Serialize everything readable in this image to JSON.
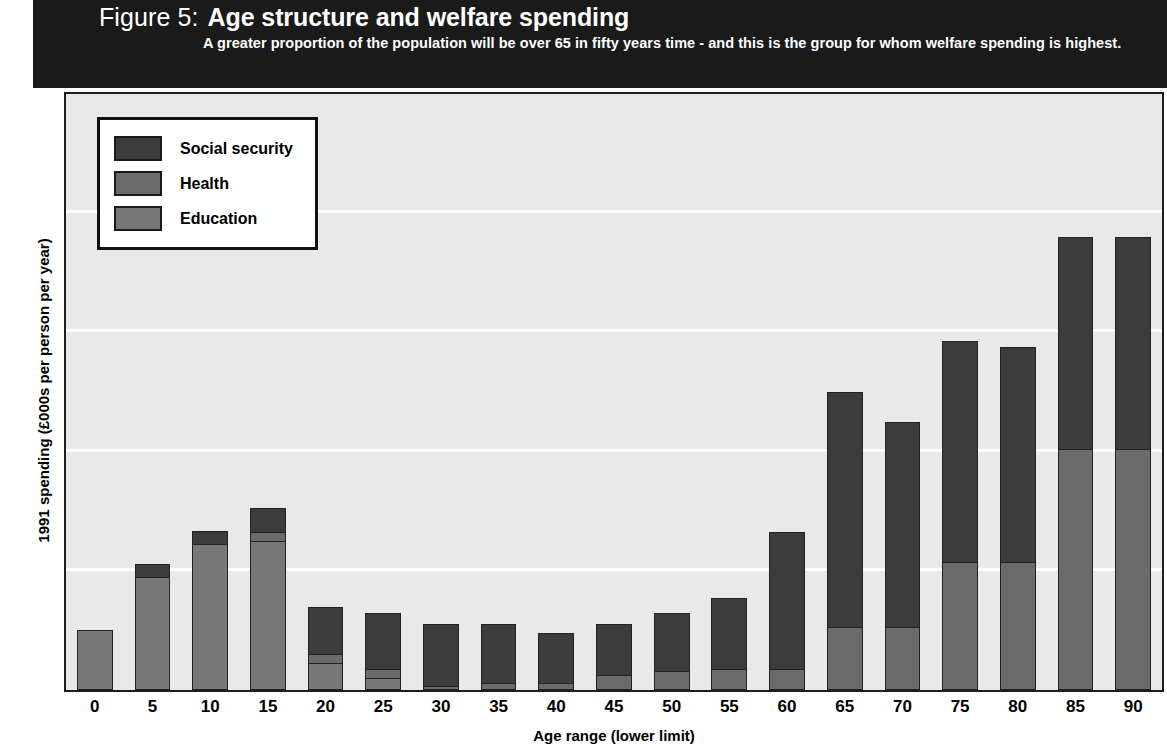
{
  "banner": {
    "figure_label": "Figure 5:",
    "title": "Age structure and welfare spending",
    "subtitle": "A greater proportion of the population will be over 65 in fifty years time - and this is the group for whom welfare spending is highest."
  },
  "legend": {
    "items": [
      {
        "label": "Social security",
        "color": "#3c3c3c",
        "key": "social_security"
      },
      {
        "label": "Health",
        "color": "#6b6b6b",
        "key": "health"
      },
      {
        "label": "Education",
        "color": "#787878",
        "key": "education"
      }
    ]
  },
  "axes": {
    "y_title": "1991 spending (£000s per person per year)",
    "x_title": "Age range (lower limit)",
    "y_ticks": [
      "0",
      "2",
      "4",
      "6",
      "8",
      "10"
    ],
    "x_ticks": [
      "0",
      "5",
      "10",
      "15",
      "20",
      "25",
      "30",
      "35",
      "40",
      "45",
      "50",
      "55",
      "60",
      "65",
      "70",
      "75",
      "80",
      "85",
      "90"
    ]
  },
  "chart_data": {
    "type": "bar",
    "stacked": true,
    "title": "Age structure and welfare spending",
    "subtitle": "A greater proportion of the population will be over 65 in fifty years time - and this is the group for whom welfare spending is highest.",
    "xlabel": "Age range (lower limit)",
    "ylabel": "1991 spending (£000s per person per year)",
    "ylim": [
      0,
      10
    ],
    "yticks": [
      0,
      2,
      4,
      6,
      8,
      10
    ],
    "grid": true,
    "legend_position": "top-left-inside",
    "categories": [
      "0",
      "5",
      "10",
      "15",
      "20",
      "25",
      "30",
      "35",
      "40",
      "45",
      "50",
      "55",
      "60",
      "65",
      "70",
      "75",
      "80",
      "85",
      "90"
    ],
    "series": [
      {
        "name": "Education",
        "color": "#787878",
        "values": [
          1.0,
          1.9,
          2.45,
          2.5,
          0.45,
          0.2,
          0.0,
          0.0,
          0.0,
          0.0,
          0.0,
          0.0,
          0.0,
          0.0,
          0.0,
          0.0,
          0.0,
          0.0,
          0.0
        ]
      },
      {
        "name": "Health",
        "color": "#6b6b6b",
        "values": [
          0.0,
          0.0,
          0.0,
          0.15,
          0.15,
          0.15,
          0.07,
          0.12,
          0.12,
          0.25,
          0.32,
          0.35,
          0.35,
          1.05,
          1.05,
          2.15,
          2.15,
          4.05,
          4.05
        ]
      },
      {
        "name": "Social security",
        "color": "#3c3c3c",
        "values": [
          0.0,
          0.22,
          0.22,
          0.4,
          0.8,
          0.95,
          1.03,
          0.98,
          0.83,
          0.85,
          0.98,
          1.2,
          2.3,
          3.95,
          3.45,
          3.7,
          3.6,
          3.55,
          3.55
        ]
      }
    ],
    "totals": [
      1.0,
      2.12,
      2.67,
      3.05,
      1.4,
      1.3,
      1.1,
      1.1,
      0.95,
      1.1,
      1.3,
      1.55,
      2.65,
      5.0,
      4.5,
      5.85,
      5.75,
      7.6,
      7.6
    ]
  }
}
